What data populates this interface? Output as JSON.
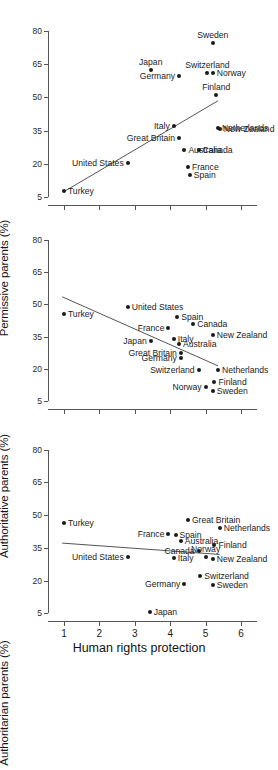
{
  "chart_data": [
    {
      "type": "scatter",
      "panel": 1,
      "title": "",
      "xlabel": "",
      "ylabel": "Permissive parents (%)",
      "xlim": [
        0.55,
        6.45
      ],
      "ylim": [
        1.5,
        84
      ],
      "xticks": [
        1,
        2,
        3,
        4,
        5,
        6
      ],
      "yticks": [
        5,
        20,
        35,
        50,
        65,
        80
      ],
      "grid": false,
      "legend": "none",
      "fit_line": {
        "x1": 1.0,
        "y1": 7.5,
        "x2": 5.35,
        "y2": 48.5
      },
      "points": [
        {
          "label": "Turkey",
          "x": 1.0,
          "y": 7.8,
          "pos": "right"
        },
        {
          "label": "United States",
          "x": 2.8,
          "y": 20.6,
          "pos": "left"
        },
        {
          "label": "Japan",
          "x": 3.45,
          "y": 62.5,
          "pos": "above"
        },
        {
          "label": "Germany",
          "x": 4.25,
          "y": 59.5,
          "pos": "left"
        },
        {
          "label": "Italy",
          "x": 4.1,
          "y": 37.2,
          "pos": "left"
        },
        {
          "label": "Great Britain",
          "x": 4.25,
          "y": 31.6,
          "pos": "left"
        },
        {
          "label": "Australia",
          "x": 4.4,
          "y": 26.2,
          "pos": "right"
        },
        {
          "label": "France",
          "x": 4.5,
          "y": 18.8,
          "pos": "right"
        },
        {
          "label": "Spain",
          "x": 4.55,
          "y": 14.8,
          "pos": "right"
        },
        {
          "label": "Canada",
          "x": 4.8,
          "y": 26.2,
          "pos": "right"
        },
        {
          "label": "Switzerland",
          "x": 5.05,
          "y": 60.8,
          "pos": "above"
        },
        {
          "label": "Norway",
          "x": 5.2,
          "y": 60.8,
          "pos": "right"
        },
        {
          "label": "Sweden",
          "x": 5.2,
          "y": 74.5,
          "pos": "above"
        },
        {
          "label": "Finland",
          "x": 5.3,
          "y": 51.2,
          "pos": "above"
        },
        {
          "label": "Netherlands",
          "x": 5.35,
          "y": 36.4,
          "pos": "right"
        },
        {
          "label": "New Zealand",
          "x": 5.4,
          "y": 35.6,
          "pos": "right"
        }
      ]
    },
    {
      "type": "scatter",
      "panel": 2,
      "title": "",
      "xlabel": "",
      "ylabel": "Authoritative parents (%)",
      "xlim": [
        0.55,
        6.45
      ],
      "ylim": [
        1.5,
        84
      ],
      "xticks": [
        1,
        2,
        3,
        4,
        5,
        6
      ],
      "yticks": [
        5,
        20,
        35,
        50,
        65,
        80
      ],
      "grid": false,
      "legend": "none",
      "fit_line": {
        "x1": 0.95,
        "y1": 53.5,
        "x2": 5.35,
        "y2": 21.5
      },
      "points": [
        {
          "label": "Turkey",
          "x": 1.0,
          "y": 45.5,
          "pos": "right"
        },
        {
          "label": "United States",
          "x": 2.8,
          "y": 48.8,
          "pos": "right"
        },
        {
          "label": "Japan",
          "x": 3.45,
          "y": 32.8,
          "pos": "left"
        },
        {
          "label": "France",
          "x": 3.95,
          "y": 39.0,
          "pos": "left"
        },
        {
          "label": "Italy",
          "x": 4.1,
          "y": 34.0,
          "pos": "right"
        },
        {
          "label": "Spain",
          "x": 4.2,
          "y": 44.2,
          "pos": "right"
        },
        {
          "label": "Australia",
          "x": 4.25,
          "y": 31.5,
          "pos": "right"
        },
        {
          "label": "Great Britain",
          "x": 4.3,
          "y": 27.5,
          "pos": "left"
        },
        {
          "label": "Germany",
          "x": 4.3,
          "y": 25.0,
          "pos": "left"
        },
        {
          "label": "Canada",
          "x": 4.65,
          "y": 40.8,
          "pos": "right"
        },
        {
          "label": "Switzerland",
          "x": 4.8,
          "y": 19.8,
          "pos": "left"
        },
        {
          "label": "Norway",
          "x": 5.0,
          "y": 11.8,
          "pos": "left"
        },
        {
          "label": "New Zealand",
          "x": 5.2,
          "y": 36.0,
          "pos": "right"
        },
        {
          "label": "Sweden",
          "x": 5.2,
          "y": 9.8,
          "pos": "right"
        },
        {
          "label": "Finland",
          "x": 5.25,
          "y": 14.2,
          "pos": "right"
        },
        {
          "label": "Netherlands",
          "x": 5.35,
          "y": 19.8,
          "pos": "right"
        }
      ]
    },
    {
      "type": "scatter",
      "panel": 3,
      "title": "",
      "xlabel": "Human rights protection",
      "ylabel": "Authoritarian parents (%)",
      "xlim": [
        0.55,
        6.45
      ],
      "ylim": [
        1.5,
        84
      ],
      "xticks": [
        1,
        2,
        3,
        4,
        5,
        6
      ],
      "yticks": [
        5,
        20,
        35,
        50,
        65,
        80
      ],
      "grid": false,
      "legend": "none",
      "fit_line": {
        "x1": 0.95,
        "y1": 37.2,
        "x2": 5.4,
        "y2": 32.0
      },
      "points": [
        {
          "label": "Turkey",
          "x": 1.0,
          "y": 46.5,
          "pos": "right"
        },
        {
          "label": "United States",
          "x": 2.8,
          "y": 30.8,
          "pos": "left"
        },
        {
          "label": "Japan",
          "x": 3.42,
          "y": 5.5,
          "pos": "right"
        },
        {
          "label": "Italy",
          "x": 4.1,
          "y": 30.2,
          "pos": "right"
        },
        {
          "label": "France",
          "x": 3.95,
          "y": 41.5,
          "pos": "left"
        },
        {
          "label": "Spain",
          "x": 4.15,
          "y": 41.0,
          "pos": "right"
        },
        {
          "label": "Germany",
          "x": 4.4,
          "y": 18.5,
          "pos": "left"
        },
        {
          "label": "Australia",
          "x": 4.3,
          "y": 38.2,
          "pos": "right"
        },
        {
          "label": "Great Britain",
          "x": 4.5,
          "y": 47.8,
          "pos": "right"
        },
        {
          "label": "Canada",
          "x": 4.8,
          "y": 33.8,
          "pos": "left"
        },
        {
          "label": "Switzerland",
          "x": 4.85,
          "y": 22.0,
          "pos": "right"
        },
        {
          "label": "Norway",
          "x": 5.0,
          "y": 30.8,
          "pos": "above"
        },
        {
          "label": "Sweden",
          "x": 5.2,
          "y": 18.2,
          "pos": "right"
        },
        {
          "label": "New Zealand",
          "x": 5.2,
          "y": 30.0,
          "pos": "right"
        },
        {
          "label": "Finland",
          "x": 5.25,
          "y": 36.2,
          "pos": "right"
        },
        {
          "label": "Netherlands",
          "x": 5.4,
          "y": 44.2,
          "pos": "right"
        }
      ]
    }
  ]
}
